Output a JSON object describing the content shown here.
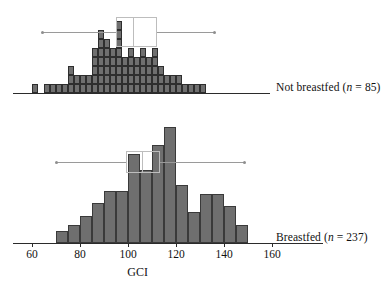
{
  "figure": {
    "axis_title": "GCI",
    "x_ticks": [
      60,
      80,
      100,
      120,
      140,
      160
    ],
    "x_tick_labels": [
      "60",
      "80",
      "100",
      "120",
      "140",
      "160"
    ],
    "colors": {
      "bar_fill": "#6f6f6f",
      "bar_stroke": "#2e2e2e",
      "axis": "#2b2b2b",
      "boxplot": "#b0b0b0"
    }
  },
  "panels": [
    {
      "id": "not-breastfed",
      "label_prefix": "Not breastfed (",
      "label_n": "n",
      "label_suffix": " = 85)",
      "n": 85,
      "style": "dotplot"
    },
    {
      "id": "breastfed",
      "label_prefix": "Breastfed (",
      "label_n": "n",
      "label_suffix": " = 237)",
      "n": 237,
      "style": "histogram"
    }
  ],
  "chart_data": {
    "type": "bar",
    "title": "",
    "xlabel": "GCI",
    "ylabel": "",
    "xlim": [
      52,
      172
    ],
    "grid": false,
    "legend": "none",
    "panel_layout": "stacked-vertical",
    "charts": [
      {
        "name": "Not breastfed (n = 85)",
        "type": "bar",
        "style": "stacked-dotplot",
        "n": 85,
        "bin_width": 2.5,
        "cell_unit": 1,
        "bin_starts": [
          60.0,
          62.5,
          65.0,
          67.5,
          70.0,
          72.5,
          75.0,
          77.5,
          80.0,
          82.5,
          85.0,
          87.5,
          90.0,
          92.5,
          95.0,
          97.5,
          100.0,
          102.5,
          105.0,
          107.5,
          110.0,
          112.5,
          115.0,
          117.5,
          120.0,
          122.5,
          125.0,
          127.5,
          130.0,
          132.5,
          135.0,
          137.5,
          140.0
        ],
        "counts": [
          1,
          0,
          1,
          1,
          1,
          1,
          3,
          2,
          2,
          2,
          5,
          7,
          6,
          5,
          8,
          4,
          5,
          4,
          5,
          4,
          5,
          3,
          2,
          2,
          2,
          1,
          1,
          1,
          1,
          0,
          0,
          0,
          0
        ],
        "boxplot": {
          "min": 64.5,
          "q1": 95.0,
          "median": 102.0,
          "q3": 112.0,
          "max": 136.0
        }
      },
      {
        "name": "Breastfed (n = 237)",
        "type": "bar",
        "style": "histogram",
        "n": 237,
        "bin_width": 5,
        "bin_starts": [
          70,
          75,
          80,
          85,
          90,
          95,
          100,
          105,
          110,
          115,
          120,
          125,
          130,
          135,
          140,
          145
        ],
        "counts": [
          4,
          6,
          9,
          13,
          17,
          17,
          29,
          24,
          32,
          38,
          19,
          10,
          16,
          16,
          12,
          6
        ],
        "boxplot": {
          "min": 70.0,
          "q1": 99.0,
          "median": 106.0,
          "q3": 113.5,
          "max": 148.5
        }
      }
    ]
  }
}
